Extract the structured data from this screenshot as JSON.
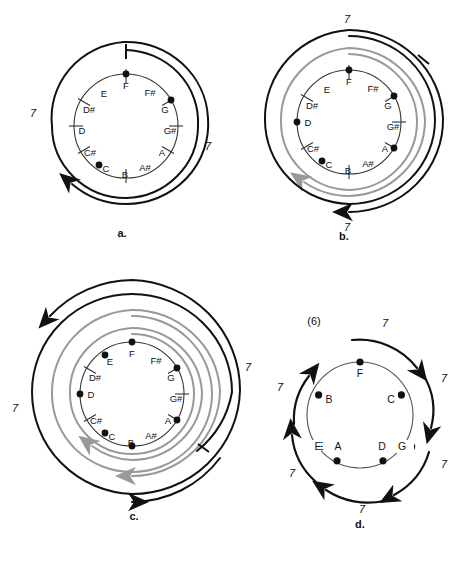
{
  "figure": {
    "background": "#ffffff",
    "ink": "#111111",
    "gray": "#999999"
  },
  "chromatic_notes": [
    "C",
    "C#",
    "D",
    "D#",
    "E",
    "F",
    "F#",
    "G",
    "G#",
    "A",
    "A#",
    "B"
  ],
  "panels": [
    {
      "id": "a",
      "caption": "a.",
      "circle_type": "chromatic-12",
      "note_labels": [
        "C",
        "C#",
        "D",
        "D#",
        "E",
        "F",
        "F#",
        "G",
        "G#",
        "A",
        "A#",
        "B"
      ],
      "marked_notes": [
        "F",
        "G",
        "C"
      ],
      "interval_labels": [
        "7",
        "7"
      ],
      "spiral_turns": 1,
      "gray_spirals": 0
    },
    {
      "id": "b",
      "caption": "b.",
      "circle_type": "chromatic-12",
      "note_labels": [
        "C",
        "C#",
        "D",
        "D#",
        "E",
        "F",
        "F#",
        "G",
        "G#",
        "A",
        "A#",
        "B"
      ],
      "marked_notes": [
        "F",
        "G",
        "A",
        "C",
        "D"
      ],
      "interval_labels": [
        "7",
        "7"
      ],
      "spiral_turns": 2,
      "gray_spirals": 1
    },
    {
      "id": "c",
      "caption": "c.",
      "circle_type": "chromatic-12",
      "note_labels": [
        "C",
        "C#",
        "D",
        "D#",
        "E",
        "F",
        "F#",
        "G",
        "G#",
        "A",
        "A#",
        "B"
      ],
      "marked_notes": [
        "C",
        "D",
        "E",
        "F",
        "G",
        "A",
        "B"
      ],
      "interval_labels": [
        "7",
        "7"
      ],
      "spiral_turns": 3,
      "gray_spirals": 2
    },
    {
      "id": "d",
      "caption": "d.",
      "circle_type": "fifths-7",
      "note_labels": [
        "F",
        "C",
        "G",
        "D",
        "A",
        "E",
        "B"
      ],
      "marked_notes": [
        "F",
        "C",
        "G",
        "D",
        "A",
        "E",
        "B"
      ],
      "interval_labels": [
        "7",
        "7",
        "7",
        "7",
        "7",
        "7"
      ],
      "size_label": "(6)",
      "spiral_turns": 1,
      "gray_spirals": 0
    }
  ]
}
